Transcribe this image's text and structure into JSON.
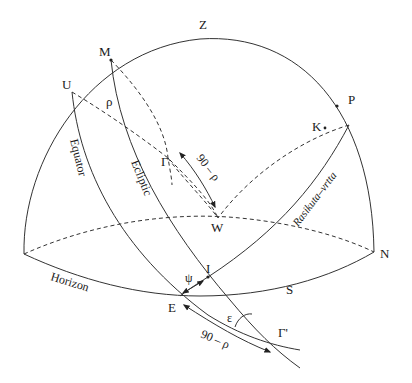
{
  "diagram": {
    "type": "celestial-sphere",
    "points": {
      "Z": "Z",
      "M": "M",
      "U": "U",
      "P": "P",
      "K": "K",
      "gamma": "Γ",
      "W": "W",
      "I": "I",
      "E": "E",
      "gamma_prime": "Γ'",
      "N": "N",
      "S": "S"
    },
    "curves": {
      "equator": "Equator",
      "ecliptic": "Ecliptic",
      "horizon": "Horizon",
      "rasikuta": "Rasikuta–vrtta"
    },
    "angles": {
      "rho": "ρ",
      "psi": "ψ",
      "epsilon": "ε",
      "arc_upper": "90 – ρ",
      "arc_lower": "90 – ρ"
    },
    "colors": {
      "line": "#333333",
      "text": "#1a1a1a",
      "background": "#ffffff"
    }
  }
}
